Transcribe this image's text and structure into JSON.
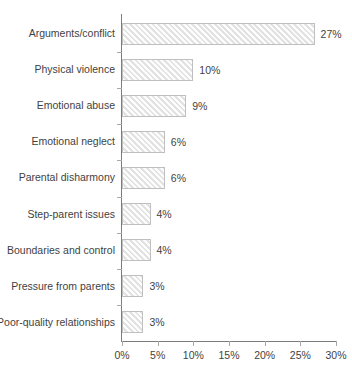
{
  "chart_data": {
    "type": "bar",
    "orientation": "horizontal",
    "title": "",
    "subtitle": "",
    "xlabel": "",
    "ylabel": "",
    "xlim": [
      0,
      30
    ],
    "grid": false,
    "legend": null,
    "categories": [
      "Arguments/conflict",
      "Physical violence",
      "Emotional abuse",
      "Emotional neglect",
      "Parental disharmony",
      "Step-parent issues",
      "Boundaries and control",
      "Pressure from parents",
      "Poor-quality relationships"
    ],
    "values": [
      27,
      10,
      9,
      6,
      6,
      4,
      4,
      3,
      3
    ],
    "value_labels": [
      "27%",
      "10%",
      "9%",
      "6%",
      "6%",
      "4%",
      "4%",
      "3%",
      "3%"
    ],
    "xticks": [
      0,
      5,
      10,
      15,
      20,
      25,
      30
    ],
    "xtick_labels": [
      "0%",
      "5%",
      "10%",
      "15%",
      "20%",
      "25%",
      "30%"
    ],
    "colors": {
      "bar_fill": "#f1f1f1",
      "bar_border": "#bfbfbf",
      "axis": "#7d7d7d",
      "text": "#3f3f3f",
      "background": "#ffffff"
    }
  }
}
